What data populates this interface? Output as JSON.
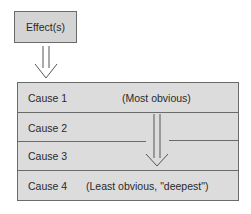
{
  "effect": {
    "label": "Effect(s)"
  },
  "causes": [
    {
      "label": "Cause 1",
      "note": "(Most obvious)"
    },
    {
      "label": "Cause 2",
      "note": ""
    },
    {
      "label": "Cause 3",
      "note": ""
    },
    {
      "label": "Cause 4",
      "note": "(Least obvious, \"deepest\")"
    }
  ],
  "colors": {
    "box_fill": "#d4d4d4",
    "table_fill": "#dcdcdc",
    "stroke": "#6a6a6a",
    "text": "#2a2a2a"
  }
}
